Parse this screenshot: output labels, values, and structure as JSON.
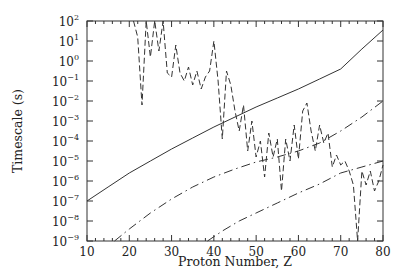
{
  "chart_data": {
    "type": "line",
    "title": "",
    "xlabel": "Proton Number, Z",
    "ylabel": "Timescale (s)",
    "xlim": [
      10,
      80
    ],
    "ylim_log10": [
      -9,
      2
    ],
    "yscale": "log",
    "grid": false,
    "legend": null,
    "x_ticks": [
      10,
      20,
      30,
      40,
      50,
      60,
      70,
      80
    ],
    "y_ticks_exponents": [
      2,
      1,
      0,
      -1,
      -2,
      -3,
      -4,
      -5,
      -6,
      -7,
      -8,
      -9
    ],
    "series": [
      {
        "name": "solid",
        "style": "solid",
        "x": [
          10,
          15,
          20,
          25,
          30,
          35,
          40,
          45,
          50,
          55,
          60,
          65,
          70,
          75,
          80
        ],
        "log10_y": [
          -7.0,
          -6.3,
          -5.6,
          -5.0,
          -4.4,
          -3.85,
          -3.3,
          -2.8,
          -2.3,
          -1.85,
          -1.4,
          -0.9,
          -0.4,
          0.6,
          1.55
        ]
      },
      {
        "name": "dash-dot-upper",
        "style": "dashdot",
        "x": [
          16.5,
          20,
          25,
          30,
          35,
          40,
          45,
          50,
          55,
          60,
          65,
          70,
          75,
          80
        ],
        "log10_y": [
          -9.0,
          -8.4,
          -7.6,
          -6.9,
          -6.3,
          -5.8,
          -5.4,
          -5.05,
          -4.8,
          -4.5,
          -4.1,
          -3.5,
          -2.8,
          -2.0
        ]
      },
      {
        "name": "dash-dot-lower",
        "style": "dashdot",
        "x": [
          38.5,
          42,
          46,
          50,
          55,
          60,
          65,
          70,
          75,
          80
        ],
        "log10_y": [
          -9.0,
          -8.5,
          -8.0,
          -7.6,
          -7.1,
          -6.6,
          -6.15,
          -5.6,
          -5.3,
          -5.0
        ]
      },
      {
        "name": "dashed",
        "style": "dashed",
        "x": [
          21,
          22,
          23,
          24,
          25,
          26,
          27,
          28,
          29,
          30,
          31,
          32,
          33,
          34,
          35,
          36,
          37,
          38,
          39,
          40,
          41,
          42,
          43,
          44,
          45,
          46,
          47,
          48,
          49,
          50,
          51,
          52,
          53,
          54,
          55,
          56,
          57,
          58,
          59,
          60,
          61,
          62,
          63,
          64,
          65,
          66,
          67,
          68,
          69,
          70,
          71,
          72,
          73,
          74,
          75,
          76,
          77,
          78,
          79,
          80
        ],
        "log10_y": [
          2.0,
          1.2,
          -2.2,
          2.0,
          0.2,
          2.0,
          0.5,
          2.0,
          -0.6,
          -0.8,
          0.8,
          -0.6,
          -1.0,
          -0.3,
          -1.2,
          -0.5,
          -1.4,
          -0.8,
          -0.5,
          1.0,
          -1.0,
          -3.9,
          -0.5,
          -1.2,
          -2.5,
          -3.5,
          -2.2,
          -4.5,
          -3.0,
          -4.8,
          -4.0,
          -5.8,
          -3.6,
          -4.8,
          -3.9,
          -6.5,
          -3.9,
          -5.0,
          -3.2,
          -4.9,
          -2.5,
          -2.1,
          -3.5,
          -4.5,
          -3.2,
          -4.1,
          -3.6,
          -5.3,
          -4.7,
          -5.2,
          -5.0,
          -5.5,
          -6.2,
          -9.0,
          -5.5,
          -6.2,
          -5.5,
          -6.5,
          -6.0,
          -5.2
        ]
      }
    ]
  }
}
